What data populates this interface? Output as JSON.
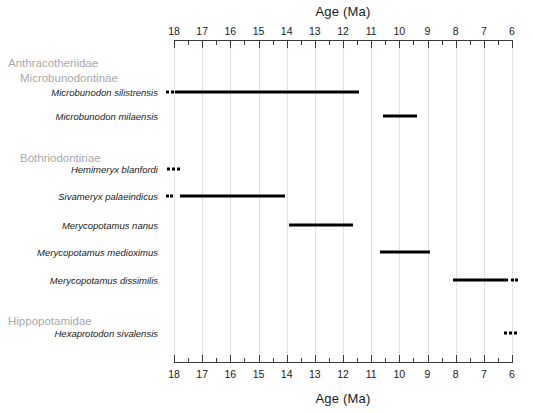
{
  "chart_data": {
    "type": "bar",
    "title": "",
    "xlabel": "Age (Ma)",
    "ylabel": "",
    "axis_title_top": "Age (Ma)",
    "axis_title_bottom": "Age (Ma)",
    "xlim": [
      18,
      6
    ],
    "x_reversed": true,
    "tick_labels": [
      "18",
      "17",
      "16",
      "15",
      "14",
      "13",
      "12",
      "11",
      "10",
      "9",
      "8",
      "7",
      "6"
    ],
    "tick_values": [
      18,
      17,
      16,
      15,
      14,
      13,
      12,
      11,
      10,
      9,
      8,
      7,
      6
    ],
    "minor_tick_step": 0.5,
    "grid": "vertical dotted gridlines at each major tick",
    "legend": "none",
    "groups": [
      {
        "label": "Anthracotheriidae",
        "level": 0
      },
      {
        "label": "Microbunodontinae",
        "level": 1
      },
      {
        "label": "Bothriodontinae",
        "level": 1
      },
      {
        "label": "Hippopotamidae",
        "level": 0
      }
    ],
    "rows": [
      {
        "name": "Microbunodon silistrensis",
        "solid_range": [
          17.95,
          11.43
        ],
        "dashed_extension": "left",
        "dash_segments": [
          [
            18.28,
            18.18
          ],
          [
            18.12,
            18.02
          ]
        ]
      },
      {
        "name": "Microbunodon milaensis",
        "solid_range": [
          10.58,
          9.38
        ],
        "dashed_extension": "none",
        "dash_segments": []
      },
      {
        "name": "Hemimeryx blanfordi",
        "solid_range": null,
        "dashed_extension": "only",
        "dash_segments": [
          [
            18.25,
            18.13
          ],
          [
            18.07,
            17.95
          ],
          [
            17.89,
            17.78
          ]
        ]
      },
      {
        "name": "Sivameryx palaeindicus",
        "solid_range": [
          17.79,
          14.07
        ],
        "dashed_extension": "left",
        "dash_segments": [
          [
            18.3,
            18.19
          ],
          [
            18.13,
            18.02
          ]
        ]
      },
      {
        "name": "Merycopotamus nanus",
        "solid_range": [
          13.92,
          11.64
        ],
        "dashed_extension": "none",
        "dash_segments": []
      },
      {
        "name": "Merycopotamus medioximus",
        "solid_range": [
          10.7,
          8.92
        ],
        "dashed_extension": "none",
        "dash_segments": []
      },
      {
        "name": "Merycopotamus dissimilis",
        "solid_range": [
          8.1,
          6.15
        ],
        "dashed_extension": "right",
        "dash_segments": [
          [
            6.05,
            5.94
          ],
          [
            5.88,
            5.78
          ]
        ]
      },
      {
        "name": "Hexaprotodon sivalensis",
        "solid_range": null,
        "dashed_extension": "only",
        "dash_segments": [
          [
            6.28,
            6.16
          ],
          [
            6.1,
            5.99
          ],
          [
            5.93,
            5.82
          ]
        ]
      }
    ]
  },
  "colors": {
    "bar": "#000000",
    "gridline": "#c9c9c9",
    "axis": "#3a3a3a",
    "group_label": "#a8a8a8",
    "taxon_label": "#1a1a1a",
    "background": "#ffffff"
  },
  "layout": {
    "plot_left_px": 174,
    "plot_right_px": 512,
    "row_y_px": [
      92,
      116,
      169,
      196,
      225,
      252,
      280,
      333
    ],
    "group_y_px": [
      57,
      72,
      152,
      315
    ],
    "axis_top_y_px": 40,
    "axis_bottom_y_px": 362
  }
}
